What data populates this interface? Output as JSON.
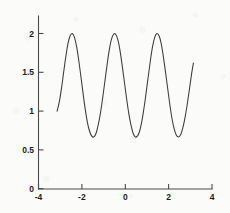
{
  "chart_data": {
    "type": "line",
    "title": "",
    "subtitle": "",
    "xlabel": "",
    "ylabel": "",
    "xlim": [
      -4,
      4
    ],
    "ylim": [
      0,
      2
    ],
    "grid": false,
    "legend": null,
    "x_ticks": [
      -4,
      -2,
      0,
      2,
      4
    ],
    "x_tick_labels": [
      "-4",
      "-2",
      "0",
      "2",
      "4"
    ],
    "y_ticks": [
      0,
      0.5,
      1,
      1.5,
      2
    ],
    "y_tick_labels": [
      "0",
      "0.5",
      "1",
      "1.5",
      "2"
    ],
    "series": [
      {
        "name": "curve",
        "color": "#3a3a3a",
        "style": "solid",
        "x_domain": [
          -3.1416,
          3.1416
        ],
        "peaks_x": [
          -2.55,
          -0.5,
          1.6
        ],
        "peaks_y": [
          2,
          2,
          2
        ],
        "valleys_x": [
          -1.5,
          0.55,
          2.6
        ],
        "valleys_y": [
          0.67,
          0.67,
          0.67
        ],
        "x": [
          -3.1416,
          -3.0416,
          -2.9416,
          -2.8416,
          -2.7416,
          -2.6416,
          -2.5416,
          -2.4416,
          -2.3416,
          -2.2416,
          -2.1416,
          -2.0416,
          -1.9416,
          -1.8416,
          -1.7416,
          -1.6416,
          -1.5416,
          -1.4416,
          -1.3416,
          -1.2416,
          -1.1416,
          -1.0416,
          -0.9416,
          -0.8416,
          -0.7416,
          -0.6416,
          -0.5416,
          -0.4416,
          -0.3416,
          -0.2416,
          -0.1416,
          -0.0416,
          0.0584,
          0.1584,
          0.2584,
          0.3584,
          0.4584,
          0.5584,
          0.6584,
          0.7584,
          0.8584,
          0.9584,
          1.0584,
          1.1584,
          1.2584,
          1.3584,
          1.4584,
          1.5584,
          1.6584,
          1.7584,
          1.8584,
          1.9584,
          2.0584,
          2.1584,
          2.2584,
          2.3584,
          2.4584,
          2.5584,
          2.6584,
          2.7584,
          2.8584,
          2.9584,
          3.0584,
          3.1416
        ],
        "y": [
          1.0,
          1.12,
          1.29,
          1.5,
          1.7,
          1.87,
          1.97,
          2.0,
          1.95,
          1.83,
          1.65,
          1.44,
          1.22,
          1.02,
          0.85,
          0.74,
          0.68,
          0.67,
          0.72,
          0.83,
          0.98,
          1.17,
          1.38,
          1.59,
          1.78,
          1.92,
          1.99,
          1.99,
          1.92,
          1.78,
          1.59,
          1.38,
          1.17,
          0.98,
          0.83,
          0.72,
          0.67,
          0.68,
          0.74,
          0.86,
          1.03,
          1.23,
          1.44,
          1.65,
          1.83,
          1.95,
          2.0,
          1.97,
          1.87,
          1.7,
          1.5,
          1.29,
          1.08,
          0.9,
          0.77,
          0.69,
          0.67,
          0.7,
          0.79,
          0.92,
          1.09,
          1.28,
          1.48,
          1.62
        ]
      }
    ]
  },
  "axes": {
    "x_axis_name": "x-axis",
    "y_axis_name": "y-axis"
  }
}
